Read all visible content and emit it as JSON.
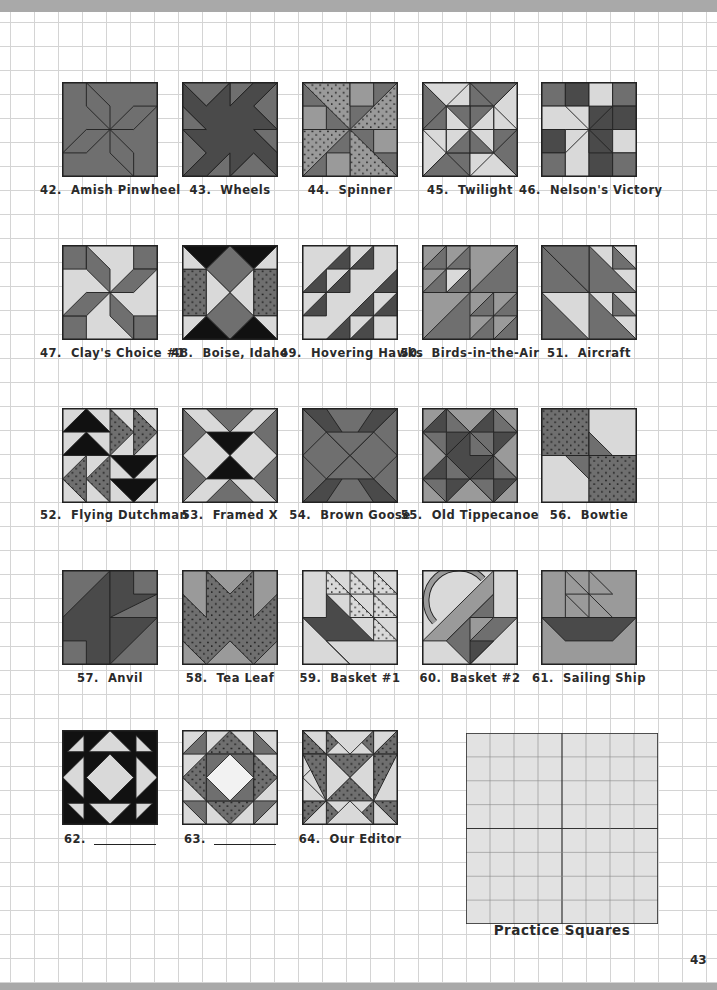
{
  "page": {
    "page_number": "43",
    "practice_label": "Practice Squares"
  },
  "colors": {
    "light": "#d9d9d9",
    "medium": "#9a9a9a",
    "dark": "#6f6f6f",
    "darker": "#4a4a4a",
    "black": "#111111",
    "outline": "#222222",
    "grid_line": "#d4d4d4",
    "band": "#a9a9a9"
  },
  "blocks": [
    {
      "number": "42.",
      "name": "Amish Pinwheel",
      "pattern": "amish-pinwheel"
    },
    {
      "number": "43.",
      "name": "Wheels",
      "pattern": "wheels"
    },
    {
      "number": "44.",
      "name": "Spinner",
      "pattern": "spinner"
    },
    {
      "number": "45.",
      "name": "Twilight",
      "pattern": "twilight"
    },
    {
      "number": "46.",
      "name": "Nelson's Victory",
      "pattern": "nelsons-victory"
    },
    {
      "number": "47.",
      "name": "Clay's Choice #1",
      "pattern": "clays-choice"
    },
    {
      "number": "48.",
      "name": "Boise, Idaho",
      "pattern": "boise-idaho"
    },
    {
      "number": "49.",
      "name": "Hovering Hawks",
      "pattern": "hovering-hawks"
    },
    {
      "number": "50.",
      "name": "Birds-in-the-Air",
      "pattern": "birds-in-the-air"
    },
    {
      "number": "51.",
      "name": "Aircraft",
      "pattern": "aircraft"
    },
    {
      "number": "52.",
      "name": "Flying Dutchman",
      "pattern": "flying-dutchman"
    },
    {
      "number": "53.",
      "name": "Framed X",
      "pattern": "framed-x"
    },
    {
      "number": "54.",
      "name": "Brown Goose",
      "pattern": "brown-goose"
    },
    {
      "number": "55.",
      "name": "Old Tippecanoe",
      "pattern": "old-tippecanoe"
    },
    {
      "number": "56.",
      "name": "Bowtie",
      "pattern": "bowtie"
    },
    {
      "number": "57.",
      "name": "Anvil",
      "pattern": "anvil"
    },
    {
      "number": "58.",
      "name": "Tea Leaf",
      "pattern": "tea-leaf"
    },
    {
      "number": "59.",
      "name": "Basket #1",
      "pattern": "basket-1"
    },
    {
      "number": "60.",
      "name": "Basket #2",
      "pattern": "basket-2"
    },
    {
      "number": "61.",
      "name": "Sailing Ship",
      "pattern": "sailing-ship"
    },
    {
      "number": "62.",
      "name": "",
      "pattern": "block-62",
      "blank_line": true
    },
    {
      "number": "63.",
      "name": "",
      "pattern": "block-63",
      "blank_line": true
    },
    {
      "number": "64.",
      "name": "Our Editor",
      "pattern": "our-editor"
    }
  ]
}
